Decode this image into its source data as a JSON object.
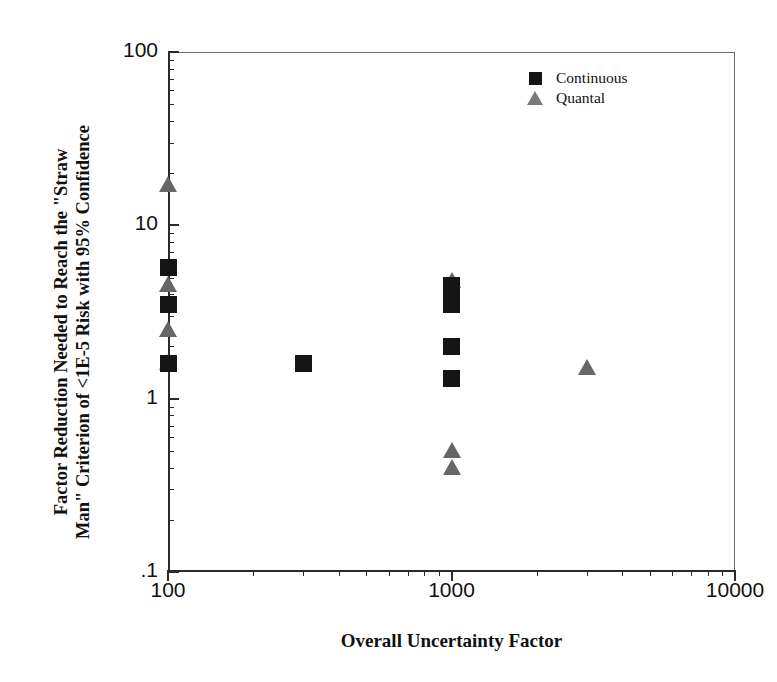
{
  "chart_data": {
    "type": "scatter",
    "title": "",
    "xlabel": "Overall Uncertainty Factor",
    "ylabel": "Factor Reduction Needed to Reach the \"Straw Man\" Criterion of <1E-5 Risk with 95% Confidence",
    "ylabel_line1": "Factor Reduction Needed to Reach the \"Straw",
    "ylabel_line2": "Man\" Criterion of <1E-5 Risk with 95% Confidence",
    "xscale": "log",
    "yscale": "log",
    "xlim": [
      100,
      10000
    ],
    "ylim": [
      0.1,
      100
    ],
    "grid": false,
    "legend_position": "top-right",
    "xticks": [
      {
        "value": 100,
        "label": "100"
      },
      {
        "value": 1000,
        "label": "1000"
      },
      {
        "value": 10000,
        "label": "10000"
      }
    ],
    "yticks": [
      {
        "value": 100,
        "label": "100"
      },
      {
        "value": 10,
        "label": "10"
      },
      {
        "value": 1,
        "label": "1"
      },
      {
        "value": 0.1,
        "label": ".1"
      }
    ],
    "series": [
      {
        "name": "Continuous",
        "marker": "square",
        "color": "#151515",
        "points": [
          {
            "x": 100,
            "y": 5.7
          },
          {
            "x": 100,
            "y": 3.5
          },
          {
            "x": 100,
            "y": 1.6
          },
          {
            "x": 300,
            "y": 1.6
          },
          {
            "x": 1000,
            "y": 4.5
          },
          {
            "x": 1000,
            "y": 4.0
          },
          {
            "x": 1000,
            "y": 3.5
          },
          {
            "x": 1000,
            "y": 2.0
          },
          {
            "x": 1000,
            "y": 1.3
          }
        ]
      },
      {
        "name": "Quantal",
        "marker": "triangle",
        "color": "#666666",
        "points": [
          {
            "x": 100,
            "y": 17.0
          },
          {
            "x": 100,
            "y": 4.5
          },
          {
            "x": 100,
            "y": 2.5
          },
          {
            "x": 100,
            "y": 1.6
          },
          {
            "x": 1000,
            "y": 4.8
          },
          {
            "x": 1000,
            "y": 0.5
          },
          {
            "x": 1000,
            "y": 0.4
          },
          {
            "x": 3000,
            "y": 1.5
          }
        ]
      }
    ]
  },
  "legend": {
    "items": [
      {
        "label": "Continuous",
        "marker": "square"
      },
      {
        "label": "Quantal",
        "marker": "triangle"
      }
    ]
  }
}
